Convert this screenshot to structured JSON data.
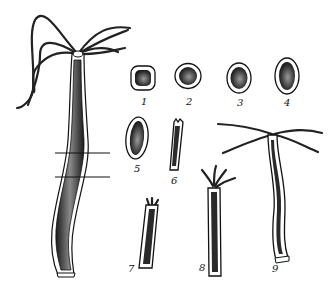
{
  "figure": {
    "colors": {
      "outline": "#111111",
      "fill_dark": "#2a2a2a",
      "fill_mid": "#7a7a7a",
      "background": "#ffffff"
    },
    "cut_lines": 2,
    "stages": [
      {
        "label": "1",
        "shape": "rounded-square fragment"
      },
      {
        "label": "2",
        "shape": "rounded fragment"
      },
      {
        "label": "3",
        "shape": "oval fragment"
      },
      {
        "label": "4",
        "shape": "elongated oval"
      },
      {
        "label": "5",
        "shape": "elongated body"
      },
      {
        "label": "6",
        "shape": "tube, rudiment buds"
      },
      {
        "label": "7",
        "shape": "tube with short tentacle buds"
      },
      {
        "label": "8",
        "shape": "tube with growing tentacles"
      },
      {
        "label": "9",
        "shape": "regenerated hydra with long tentacles"
      }
    ]
  }
}
